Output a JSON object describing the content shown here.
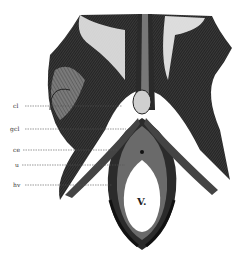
{
  "figure": {
    "type": "anatomical-engraving",
    "labels": [
      {
        "id": "cl",
        "text": "cl",
        "x": 13,
        "y": 103,
        "lineTo": 122
      },
      {
        "id": "gcl",
        "text": "gcl",
        "x": 12,
        "y": 126,
        "lineTo": 126
      },
      {
        "id": "ce",
        "text": "ce",
        "x": 13,
        "y": 147,
        "lineTo": 118
      },
      {
        "id": "u",
        "text": "u",
        "x": 15,
        "y": 162,
        "lineTo": 125
      },
      {
        "id": "hv",
        "text": "hv",
        "x": 13,
        "y": 182,
        "lineTo": 112
      }
    ],
    "center_label": "V.",
    "colors": {
      "ink": "#1a1a1a",
      "mid": "#555555",
      "paper": "#ffffff"
    }
  }
}
